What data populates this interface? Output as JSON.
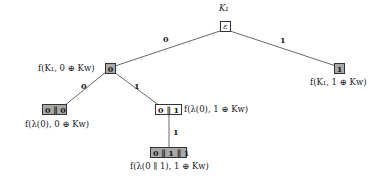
{
  "diagram": {
    "type": "binary-tree",
    "root": {
      "label_above": "K₁",
      "value": "ε",
      "shaded": false
    },
    "nodes": [
      {
        "id": "n0",
        "value": "0",
        "shaded": true,
        "label": "f(K₁, 0 ⊕ Kw)",
        "label_pos": "left"
      },
      {
        "id": "n1",
        "value": "1",
        "shaded": true,
        "label": "f(K₁, 1 ⊕ Kw)",
        "label_pos": "below"
      },
      {
        "id": "n00",
        "value": "0 ∥ 0",
        "shaded": true,
        "label": "f(λ(0), 0 ⊕ Kw)",
        "label_pos": "below"
      },
      {
        "id": "n01",
        "value": "0 ∥ 1",
        "shaded": false,
        "label": "f(λ(0), 1 ⊕ Kw)",
        "label_pos": "right"
      },
      {
        "id": "n011",
        "value": "0 ∥ 1 ∥ 1",
        "shaded": true,
        "label": "f(λ(0 ∥ 1), 1 ⊕ Kw)",
        "label_pos": "below"
      }
    ],
    "edges": [
      {
        "from": "root",
        "to": "n0",
        "label": "0"
      },
      {
        "from": "root",
        "to": "n1",
        "label": "1"
      },
      {
        "from": "n0",
        "to": "n00",
        "label": "0"
      },
      {
        "from": "n0",
        "to": "n01",
        "label": "1"
      },
      {
        "from": "n01",
        "to": "n011",
        "label": "1"
      }
    ],
    "colors": {
      "shaded_fill": "#a8a8a8",
      "plain_fill": "#ffffff",
      "stroke": "#333333"
    }
  }
}
